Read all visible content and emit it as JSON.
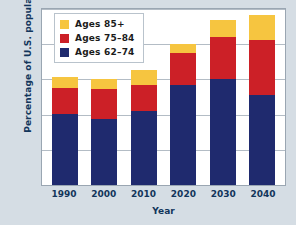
{
  "chart_data": {
    "type": "bar",
    "stacked": true,
    "title": "",
    "xlabel": "Year",
    "ylabel": "Percentage of U.S. population",
    "categories": [
      "1990",
      "2000",
      "2010",
      "2020",
      "2030",
      "2040"
    ],
    "series": [
      {
        "name": "Ages 62–74",
        "color": "#1f2a6e",
        "values": [
          10.1,
          9.4,
          10.5,
          14.2,
          15.0,
          12.8
        ]
      },
      {
        "name": "Ages 75–84",
        "color": "#cc2027",
        "values": [
          3.7,
          4.2,
          3.7,
          4.5,
          6.0,
          7.8
        ]
      },
      {
        "name": "Ages 85+",
        "color": "#f6c540",
        "values": [
          1.5,
          1.5,
          2.1,
          1.4,
          2.4,
          3.6
        ]
      }
    ],
    "totals": [
      15.3,
      15.1,
      16.3,
      20.1,
      23.4,
      24.2
    ],
    "ylim": [
      0,
      25
    ],
    "yticks": [
      "0",
      "5",
      "10",
      "15",
      "20",
      "25"
    ],
    "ytick_values": [
      0,
      5,
      10,
      15,
      20,
      25
    ],
    "grid": true,
    "legend_position": "top-left-inside",
    "legend_order": [
      "Ages 85+",
      "Ages 75–84",
      "Ages 62–74"
    ]
  },
  "legend": {
    "items": [
      {
        "label": "Ages 85+",
        "color": "#f6c540",
        "swatch_name": "legend-swatch-ages-85-plus"
      },
      {
        "label": "Ages 75–84",
        "color": "#cc2027",
        "swatch_name": "legend-swatch-ages-75-84"
      },
      {
        "label": "Ages 62–74",
        "color": "#1f2a6e",
        "swatch_name": "legend-swatch-ages-62-74"
      }
    ]
  },
  "colors": {
    "background": "#d5dde4",
    "plot_background": "#ffffff",
    "axis_text": "#12355b",
    "grid": "#9aa6b2",
    "navy": "#1f2a6e",
    "red": "#cc2027",
    "yellow": "#f6c540"
  }
}
